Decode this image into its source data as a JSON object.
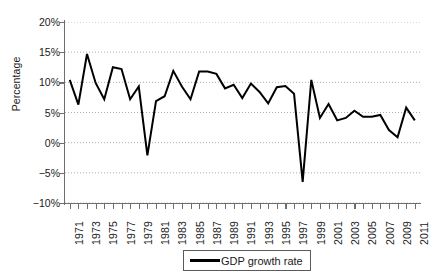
{
  "chart_data": {
    "type": "line",
    "title": "",
    "xlabel": "",
    "ylabel": "Percentage",
    "ylim": [
      -10,
      20
    ],
    "y_ticks": [
      20,
      15,
      10,
      5,
      0,
      -5,
      -10
    ],
    "y_tick_labels": [
      "20%",
      "15%",
      "10%",
      "5%",
      "0%",
      "−5%",
      "−10%"
    ],
    "grid": true,
    "grid_style": "dotted-horizontal",
    "legend_position": "bottom-center",
    "x": [
      1971,
      1972,
      1973,
      1974,
      1975,
      1976,
      1977,
      1978,
      1979,
      1980,
      1981,
      1982,
      1983,
      1984,
      1985,
      1986,
      1987,
      1988,
      1989,
      1990,
      1991,
      1992,
      1993,
      1994,
      1995,
      1996,
      1997,
      1998,
      1999,
      2000,
      2001,
      2002,
      2003,
      2004,
      2005,
      2006,
      2007,
      2008,
      2009,
      2010,
      2011
    ],
    "x_tick_labels": [
      "1971",
      "1972",
      "1973",
      "1974",
      "1975",
      "1976",
      "1977",
      "1978",
      "1979",
      "1980",
      "1981",
      "1982",
      "1983",
      "1984",
      "1985",
      "1986",
      "1987",
      "1988",
      "1989",
      "1990",
      "1991",
      "1992",
      "1993",
      "1994",
      "1995",
      "1996",
      "1997",
      "1998",
      "1999",
      "2000",
      "2001",
      "2002",
      "2003",
      "2004",
      "2005",
      "2006",
      "2007",
      "2008",
      "2009",
      "2010",
      "2011"
    ],
    "x_labels_shown": [
      "1971",
      "1973",
      "1975",
      "1977",
      "1979",
      "1981",
      "1983",
      "1985",
      "1987",
      "1989",
      "1991",
      "1993",
      "1995",
      "1997",
      "1999",
      "2001",
      "2003",
      "2005",
      "2007",
      "2009",
      "2011"
    ],
    "series": [
      {
        "name": "GDP growth rate",
        "color": "#000000",
        "values": [
          10.4,
          6.3,
          14.7,
          9.9,
          7.2,
          12.5,
          12.2,
          7.2,
          9.3,
          -2.1,
          6.9,
          7.7,
          11.9,
          9.3,
          7.2,
          11.8,
          11.8,
          11.4,
          9.0,
          9.6,
          7.4,
          9.8,
          8.4,
          6.5,
          9.2,
          9.4,
          8.1,
          -6.5,
          10.4,
          4.1,
          6.4,
          3.7,
          4.1,
          5.3,
          4.3,
          4.3,
          4.6,
          2.1,
          0.9,
          5.8,
          3.7
        ]
      }
    ]
  },
  "legend": {
    "entries": [
      {
        "label": "GDP growth rate"
      }
    ]
  }
}
